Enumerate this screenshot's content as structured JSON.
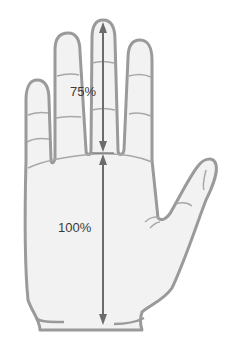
{
  "diagram": {
    "labels": {
      "finger_ratio": "75%",
      "palm_ratio": "100%"
    },
    "colors": {
      "skin_fill": "#f2f2f2",
      "outline": "#9a9a9a",
      "crease": "#a8a8a8",
      "arrow": "#6b6b6b",
      "text": "#3a3a3a",
      "background": "#ffffff"
    },
    "measurements": [
      {
        "segment": "middle finger length",
        "value": "75%"
      },
      {
        "segment": "palm length",
        "value": "100%"
      }
    ]
  }
}
